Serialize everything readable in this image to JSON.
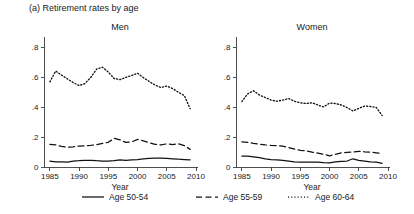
{
  "figure": {
    "title": "(a) Retirement rates by age",
    "background": "#ffffff",
    "ink_color": "#111111"
  },
  "panels": [
    {
      "id": "men",
      "title": "Men",
      "xlabel": "Year"
    },
    {
      "id": "women",
      "title": "Women",
      "xlabel": "Year"
    }
  ],
  "legend": {
    "position": "bottom-center",
    "entries": [
      {
        "label": "Age 50-54",
        "style": "solid"
      },
      {
        "label": "Age 55-59",
        "style": "dashed"
      },
      {
        "label": "Age 60-64",
        "style": "dotted"
      }
    ]
  },
  "axes": {
    "y_ticks": [
      "0",
      ".2",
      ".4",
      ".6",
      ".8"
    ],
    "y_tick_values": [
      0,
      0.2,
      0.4,
      0.6,
      0.8
    ],
    "x_ticks": [
      "1985",
      "1990",
      "1995",
      "2000",
      "2005",
      "2010"
    ],
    "x_tick_values": [
      1985,
      1990,
      1995,
      2000,
      2005,
      2010
    ],
    "ylim": [
      0,
      0.85
    ],
    "xlim": [
      1984,
      2010
    ],
    "grid": false
  },
  "chart_data": {
    "type": "line",
    "title": "(a) Retirement rates by age",
    "xlabel": "Year",
    "ylabel": "",
    "xlim": [
      1984,
      2010
    ],
    "ylim": [
      0,
      0.85
    ],
    "grid": false,
    "legend_position": "bottom-center",
    "x": [
      1985,
      1986,
      1987,
      1988,
      1989,
      1990,
      1991,
      1992,
      1993,
      1994,
      1995,
      1996,
      1997,
      1998,
      1999,
      2000,
      2001,
      2002,
      2003,
      2004,
      2005,
      2006,
      2007,
      2008,
      2009
    ],
    "panels": [
      {
        "name": "Men",
        "series": [
          {
            "name": "Age 50-54",
            "style": "solid",
            "values": [
              0.04,
              0.035,
              0.035,
              0.033,
              0.04,
              0.042,
              0.045,
              0.045,
              0.042,
              0.04,
              0.04,
              0.042,
              0.048,
              0.045,
              0.048,
              0.05,
              0.055,
              0.058,
              0.06,
              0.06,
              0.058,
              0.055,
              0.052,
              0.05,
              0.048
            ]
          },
          {
            "name": "Age 55-59",
            "style": "dashed",
            "values": [
              0.152,
              0.148,
              0.138,
              0.132,
              0.135,
              0.14,
              0.142,
              0.145,
              0.15,
              0.158,
              0.165,
              0.192,
              0.182,
              0.165,
              0.168,
              0.185,
              0.175,
              0.163,
              0.152,
              0.148,
              0.155,
              0.15,
              0.155,
              0.143,
              0.118
            ]
          },
          {
            "name": "Age 60-64",
            "style": "dotted",
            "values": [
              0.57,
              0.642,
              0.615,
              0.59,
              0.565,
              0.545,
              0.558,
              0.6,
              0.655,
              0.668,
              0.635,
              0.592,
              0.585,
              0.6,
              0.612,
              0.628,
              0.598,
              0.572,
              0.548,
              0.532,
              0.542,
              0.525,
              0.5,
              0.478,
              0.39
            ]
          }
        ]
      },
      {
        "name": "Women",
        "series": [
          {
            "name": "Age 50-54",
            "style": "solid",
            "values": [
              0.073,
              0.072,
              0.068,
              0.062,
              0.055,
              0.05,
              0.048,
              0.045,
              0.04,
              0.035,
              0.033,
              0.032,
              0.032,
              0.033,
              0.03,
              0.028,
              0.035,
              0.038,
              0.04,
              0.055,
              0.045,
              0.04,
              0.035,
              0.032,
              0.025
            ]
          },
          {
            "name": "Age 55-59",
            "style": "dashed",
            "values": [
              0.168,
              0.165,
              0.158,
              0.152,
              0.148,
              0.145,
              0.143,
              0.14,
              0.13,
              0.12,
              0.112,
              0.108,
              0.1,
              0.093,
              0.085,
              0.075,
              0.085,
              0.095,
              0.098,
              0.1,
              0.105,
              0.102,
              0.1,
              0.095,
              0.09
            ]
          },
          {
            "name": "Age 60-64",
            "style": "dotted",
            "values": [
              0.438,
              0.49,
              0.51,
              0.482,
              0.465,
              0.448,
              0.44,
              0.448,
              0.458,
              0.44,
              0.43,
              0.425,
              0.43,
              0.415,
              0.402,
              0.428,
              0.425,
              0.415,
              0.398,
              0.375,
              0.392,
              0.408,
              0.405,
              0.398,
              0.345
            ]
          }
        ]
      }
    ]
  }
}
